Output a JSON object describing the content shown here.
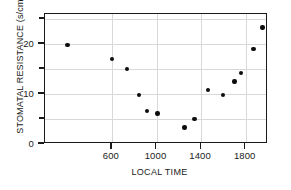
{
  "chart_data": {
    "type": "scatter",
    "title": "",
    "xlabel": "LOCAL TIME",
    "ylabel": "STOMATAL RESISTANCE (s/cm)",
    "xlim": [
      0,
      2000
    ],
    "ylim": [
      0,
      26
    ],
    "grid": true,
    "legend": null,
    "xticks": [
      600,
      1000,
      1400,
      1800
    ],
    "xtick_labels": [
      "600",
      "1000",
      "1400",
      "1800"
    ],
    "yticks": [
      0,
      10,
      20
    ],
    "ytick_labels": [
      "0",
      "10",
      "20"
    ],
    "y_minor_ticks": [
      5,
      15,
      25
    ],
    "marker": "filled-circle",
    "marker_color": "#0d0d0d",
    "grid_color": "#d8d8d8",
    "axis_color": "#1a1a1a",
    "background": "#ffffff",
    "x": [
      200,
      600,
      735,
      845,
      915,
      1010,
      1250,
      1340,
      1460,
      1595,
      1700,
      1760,
      1870,
      1950
    ],
    "y": [
      19.8,
      17.0,
      15.0,
      9.8,
      6.6,
      6.1,
      3.3,
      5.0,
      10.8,
      9.8,
      12.5,
      14.2,
      19.0,
      23.3
    ],
    "points": [
      {
        "x": 200,
        "y": 19.8
      },
      {
        "x": 600,
        "y": 17.0
      },
      {
        "x": 735,
        "y": 15.0
      },
      {
        "x": 845,
        "y": 9.8
      },
      {
        "x": 915,
        "y": 6.6
      },
      {
        "x": 1010,
        "y": 6.1
      },
      {
        "x": 1250,
        "y": 3.3
      },
      {
        "x": 1340,
        "y": 5.0
      },
      {
        "x": 1460,
        "y": 10.8
      },
      {
        "x": 1595,
        "y": 9.8
      },
      {
        "x": 1700,
        "y": 12.5
      },
      {
        "x": 1760,
        "y": 14.2
      },
      {
        "x": 1870,
        "y": 19.0
      },
      {
        "x": 1950,
        "y": 23.3
      }
    ]
  }
}
